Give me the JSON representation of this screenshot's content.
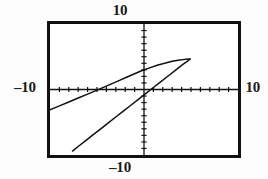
{
  "screen": {
    "kind": "graphing-calculator-viewport",
    "background_color": "#ffffff",
    "ink_color": "#111111"
  },
  "labels": {
    "top": "10",
    "bottom": "–10",
    "left": "–10",
    "right": "10"
  },
  "chart_data": {
    "type": "line",
    "title": "",
    "subtitle": "",
    "xlabel": "",
    "ylabel": "",
    "xlim": [
      -10,
      10
    ],
    "ylim": [
      -10,
      10
    ],
    "xticks": [
      -9,
      -8,
      -7,
      -6,
      -5,
      -4,
      -3,
      -2,
      -1,
      1,
      2,
      3,
      4,
      5,
      6,
      7,
      8,
      9
    ],
    "yticks": [
      -9,
      -8,
      -7,
      -6,
      -5,
      -4,
      -3,
      -2,
      -1,
      1,
      2,
      3,
      4,
      5,
      6,
      7,
      8,
      9
    ],
    "xtick_labels": [
      "-10",
      "10"
    ],
    "ytick_labels": [
      "-10",
      "10"
    ],
    "grid": false,
    "legend": null,
    "axis_style": "crosshair-with-tick-marks",
    "annotations": [],
    "series": [
      {
        "name": "upper-branch",
        "description": "Branch entering from the left edge, rising through the second quadrant, crossing the y-axis above the origin and closing at the loop tip on the right.",
        "points": [
          [
            -10.0,
            -3.1
          ],
          [
            -9.0,
            -2.5
          ],
          [
            -8.0,
            -1.9
          ],
          [
            -7.0,
            -1.3
          ],
          [
            -6.0,
            -0.7
          ],
          [
            -5.0,
            -0.1
          ],
          [
            -4.2,
            0.4
          ],
          [
            -3.4,
            0.9
          ],
          [
            -2.6,
            1.4
          ],
          [
            -1.8,
            1.9
          ],
          [
            -1.0,
            2.4
          ],
          [
            -0.2,
            2.9
          ],
          [
            0.6,
            3.3
          ],
          [
            1.4,
            3.7
          ],
          [
            2.2,
            4.0
          ],
          [
            3.0,
            4.3
          ],
          [
            3.8,
            4.5
          ],
          [
            4.4,
            4.6
          ],
          [
            4.9,
            4.65
          ]
        ]
      },
      {
        "name": "lower-branch",
        "description": "Branch entering from the bottom-left, rising steeply through the third quadrant, crossing the x-axis just right of the origin and meeting the upper branch at the loop tip.",
        "points": [
          [
            -7.6,
            -9.4
          ],
          [
            -7.0,
            -8.7
          ],
          [
            -6.2,
            -7.8
          ],
          [
            -5.4,
            -6.9
          ],
          [
            -4.6,
            -6.0
          ],
          [
            -3.8,
            -5.1
          ],
          [
            -3.0,
            -4.2
          ],
          [
            -2.2,
            -3.3
          ],
          [
            -1.4,
            -2.4
          ],
          [
            -0.6,
            -1.5
          ],
          [
            0.2,
            -0.6
          ],
          [
            1.0,
            0.3
          ],
          [
            1.8,
            1.2
          ],
          [
            2.6,
            2.1
          ],
          [
            3.4,
            3.0
          ],
          [
            4.1,
            3.8
          ],
          [
            4.6,
            4.3
          ],
          [
            4.9,
            4.65
          ]
        ]
      }
    ]
  }
}
